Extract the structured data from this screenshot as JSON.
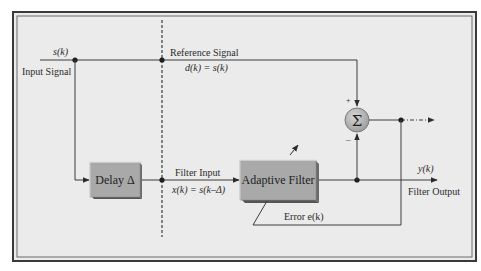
{
  "diagram": {
    "type": "block-diagram",
    "colors": {
      "background": "#ebebeb",
      "frame": "#3a3a3a",
      "block_fill": "#a9a9a9",
      "block_shadow": "#6a6a6a",
      "line": "#3c3c3c",
      "sum_fill": "#b8b8b8"
    },
    "labels": {
      "input_symbol": "s(k)",
      "input_label": "Input Signal",
      "reference_label": "Reference Signal",
      "reference_eq": "d(k) = s(k)",
      "delay_block": "Delay Δ",
      "filter_input_label": "Filter Input",
      "filter_input_eq": "x(k) = s(k–Δ)",
      "adaptive_block": "Adaptive Filter",
      "output_symbol": "y(k)",
      "output_label": "Filter Output",
      "error_label": "Error e(k)",
      "sum_symbol": "Σ",
      "plus_sign": "+",
      "minus_sign": "–"
    },
    "nodes": [
      {
        "id": "input",
        "label": "Input Signal s(k)"
      },
      {
        "id": "delay",
        "label": "Delay Δ"
      },
      {
        "id": "adaptive_filter",
        "label": "Adaptive Filter"
      },
      {
        "id": "summer",
        "label": "Σ"
      },
      {
        "id": "output",
        "label": "Filter Output y(k)"
      }
    ],
    "edges": [
      {
        "from": "input",
        "to": "summer",
        "label": "Reference Signal d(k) = s(k)",
        "sign": "+"
      },
      {
        "from": "input",
        "to": "delay"
      },
      {
        "from": "delay",
        "to": "adaptive_filter",
        "label": "Filter Input x(k) = s(k–Δ)"
      },
      {
        "from": "adaptive_filter",
        "to": "output",
        "label": "y(k)"
      },
      {
        "from": "adaptive_filter",
        "to": "summer",
        "sign": "–"
      },
      {
        "from": "summer",
        "to": "adaptive_filter",
        "label": "Error e(k)"
      }
    ]
  }
}
